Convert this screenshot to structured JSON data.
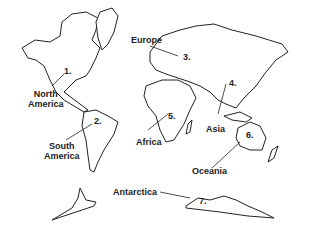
{
  "map": {
    "title": "World Continents",
    "continents": [
      {
        "number": "1.",
        "name": "North America"
      },
      {
        "number": "2.",
        "name": "South America"
      },
      {
        "number": "3.",
        "name": "Europe"
      },
      {
        "number": "4.",
        "name": "Asia"
      },
      {
        "number": "5.",
        "name": "Africa"
      },
      {
        "number": "6.",
        "name": "Oceania"
      },
      {
        "number": "7.",
        "name": "Antarctica"
      }
    ],
    "labels": {
      "north_america_line1": "North",
      "north_america_line2": "America",
      "south_america_line1": "South",
      "south_america_line2": "America",
      "europe": "Europe",
      "asia": "Asia",
      "africa": "Africa",
      "oceania": "Oceania",
      "antarctica": "Antarctica"
    },
    "colors": {
      "outline": "#222222",
      "background": "#ffffff"
    }
  }
}
